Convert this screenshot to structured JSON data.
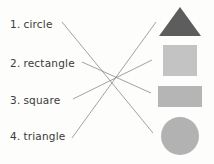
{
  "worksheet": {
    "type": "matching-exercise",
    "background_color": "#fdfdfc",
    "line_color": "#8a8a8a"
  },
  "words": [
    {
      "number": "1.",
      "label": "circle",
      "matches": "circle-shape"
    },
    {
      "number": "2.",
      "label": "rectangle",
      "matches": "rectangle-shape"
    },
    {
      "number": "3.",
      "label": "square",
      "matches": "square-shape"
    },
    {
      "number": "4.",
      "label": "triangle",
      "matches": "triangle-shape"
    }
  ],
  "shapes": [
    {
      "name": "triangle",
      "color": "#5d5d5d"
    },
    {
      "name": "square",
      "color": "#c3c3c3"
    },
    {
      "name": "rectangle",
      "color": "#b5b5b5"
    },
    {
      "name": "circle",
      "color": "#b2b2b2"
    }
  ],
  "connections": [
    {
      "from": "circle",
      "to": "circle-shape",
      "x1": 62,
      "y1": 22,
      "x2": 153,
      "y2": 133
    },
    {
      "from": "rectangle",
      "to": "rectangle-shape",
      "x1": 82,
      "y1": 62,
      "x2": 151,
      "y2": 93
    },
    {
      "from": "square",
      "to": "square-shape",
      "x1": 73,
      "y1": 99,
      "x2": 152,
      "y2": 60
    },
    {
      "from": "triangle",
      "to": "triangle-shape",
      "x1": 72,
      "y1": 138,
      "x2": 156,
      "y2": 22
    }
  ]
}
